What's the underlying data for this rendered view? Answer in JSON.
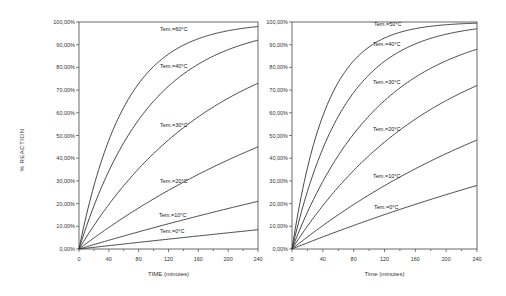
{
  "chart_data": [
    {
      "type": "line",
      "title": "",
      "xlabel": "TIME (minutes)",
      "ylabel": "% REACTION",
      "xlim": [
        0,
        240
      ],
      "ylim": [
        0,
        100
      ],
      "x_ticks": [
        "0",
        "40",
        "80",
        "120",
        "160",
        "200",
        "240"
      ],
      "y_ticks": [
        "0,00%",
        "10,00%",
        "20,00%",
        "30,00%",
        "40,00%",
        "50,00%",
        "60,00%",
        "70,00%",
        "80,00%",
        "90,00%",
        "100,00%"
      ],
      "grid": false,
      "series": [
        {
          "name": "Tem.=60C",
          "end_value": 98
        },
        {
          "name": "Tem.=40C",
          "end_value": 92
        },
        {
          "name": "Tem.=30C",
          "end_value": 73
        },
        {
          "name": "Tem.=20C",
          "end_value": 45
        },
        {
          "name": "Tem.=10C",
          "end_value": 21
        },
        {
          "name": "Tem.=0C",
          "end_value": 8.5
        }
      ]
    },
    {
      "type": "line",
      "title": "",
      "xlabel": "Time (minutes)",
      "ylabel": "",
      "xlim": [
        0,
        240
      ],
      "ylim": [
        0,
        100
      ],
      "x_ticks": [
        "0",
        "40",
        "80",
        "120",
        "160",
        "200",
        "240"
      ],
      "y_ticks": [
        "0,00%",
        "10,00%",
        "20,00%",
        "30,00%",
        "40,00%",
        "50,00%",
        "60,00%",
        "70,00%",
        "80,00%",
        "90,00%",
        "100,00%"
      ],
      "grid": false,
      "series": [
        {
          "name": "Tem.=50C",
          "end_value": 99.5
        },
        {
          "name": "Tem.=40C",
          "end_value": 97
        },
        {
          "name": "Tem.=30C",
          "end_value": 88
        },
        {
          "name": "Tem.=20C",
          "end_value": 72
        },
        {
          "name": "Tem.=10C",
          "end_value": 48
        },
        {
          "name": "Tem.=0C",
          "end_value": 28
        }
      ]
    }
  ],
  "ylabel_shared": "% REACTION",
  "labels_left": [
    {
      "text": "Tem.=60C",
      "x": 160,
      "y": 31
    },
    {
      "text": "Tem.=40C",
      "x": 160,
      "y": 68
    },
    {
      "text": "Tem.=30C",
      "x": 160,
      "y": 127
    },
    {
      "text": "Tem.=20C",
      "x": 160,
      "y": 183
    },
    {
      "text": "Tem.=10C",
      "x": 159,
      "y": 217
    },
    {
      "text": "Tem.=0C",
      "x": 160,
      "y": 233
    }
  ],
  "labels_right": [
    {
      "text": "Tem.=50C",
      "x": 374,
      "y": 26
    },
    {
      "text": "Tem.=40C",
      "x": 373,
      "y": 46
    },
    {
      "text": "Tem.=30C",
      "x": 373,
      "y": 84
    },
    {
      "text": "Tem.=20C",
      "x": 373,
      "y": 131
    },
    {
      "text": "Tem.=10C",
      "x": 373,
      "y": 178
    },
    {
      "text": "Tem.=0C",
      "x": 374,
      "y": 209
    }
  ]
}
